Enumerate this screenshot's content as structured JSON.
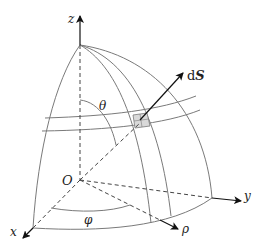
{
  "figure": {
    "labels": {
      "z_axis": "z",
      "x_axis": "x",
      "y_axis": "y",
      "origin": "O",
      "rho": "ρ",
      "theta": "θ",
      "phi": "φ",
      "dS_prefix": "d",
      "dS_vector": "S"
    },
    "colors": {
      "lines": "#7a7a7a",
      "axes": "#111111",
      "patch_fill": "#d9d9d9"
    }
  }
}
